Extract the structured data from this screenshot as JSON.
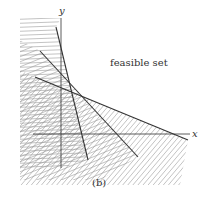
{
  "figure": {
    "caption": "(b)",
    "region_label": "feasible set",
    "x_axis_label": "x",
    "y_axis_label": "y"
  },
  "constraints": [
    {
      "name": "constraint-1",
      "description": "steep line, infeasible side to the left"
    },
    {
      "name": "constraint-2",
      "description": "medium slope line, infeasible side below-left"
    },
    {
      "name": "constraint-3",
      "description": "shallow slope line, infeasible side below"
    }
  ],
  "colors": {
    "line": "#333333",
    "hatch": "#9a9a9a",
    "axis": "#333333",
    "text": "#333333"
  }
}
